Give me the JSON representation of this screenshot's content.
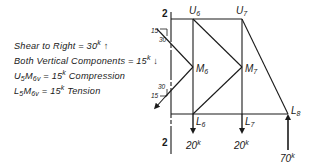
{
  "notes": [
    {
      "text": "Shear to Right = 30",
      "sup": "k",
      "arrow": "↑"
    },
    {
      "text": "Both Vertical Components = 15",
      "sup": "k",
      "arrow": "↓"
    },
    {
      "prefix": "U",
      "s1": "5",
      "mid": "M",
      "s2": "6v",
      "text": " = 15",
      "sup": "k",
      "suffix": " Compression"
    },
    {
      "prefix": "L",
      "s1": "5",
      "mid": "M",
      "s2": "6v",
      "text": " = 15",
      "sup": "k",
      "suffix": " Tension"
    }
  ],
  "section": {
    "top": "2",
    "bottom": "2"
  },
  "nodes": {
    "U6": {
      "letter": "U",
      "sub": "6"
    },
    "U7": {
      "letter": "U",
      "sub": "7"
    },
    "M6": {
      "letter": "M",
      "sub": "6"
    },
    "M7": {
      "letter": "M",
      "sub": "7"
    },
    "L6": {
      "letter": "L",
      "sub": "6"
    },
    "L7": {
      "letter": "L",
      "sub": "7"
    },
    "L8": {
      "letter": "L",
      "sub": "8"
    }
  },
  "slopes": {
    "upper": {
      "rise": "15",
      "run": "30"
    },
    "lower": {
      "rise": "15",
      "run": "30"
    }
  },
  "loads": {
    "L6": {
      "value": "20",
      "unit": "k",
      "direction": "down"
    },
    "L7": {
      "value": "20",
      "unit": "k",
      "direction": "down"
    },
    "L8": {
      "value": "70",
      "unit": "k",
      "direction": "up"
    }
  }
}
